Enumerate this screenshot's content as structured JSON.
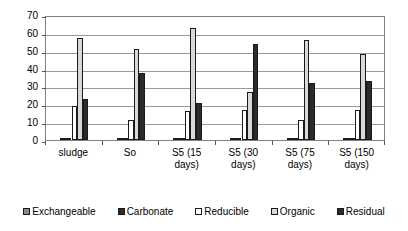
{
  "chart_data": {
    "type": "bar",
    "title": "",
    "xlabel": "",
    "ylabel": "",
    "ylim": [
      0,
      70
    ],
    "yticks": [
      0,
      10,
      20,
      30,
      40,
      50,
      60,
      70
    ],
    "grid": true,
    "legend_position": "bottom",
    "categories": [
      "sludge",
      "So",
      "S5 (15 days)",
      "S5 (30 days)",
      "S5 (75 days)",
      "S5 (150 days)"
    ],
    "category_lines": [
      [
        "sludge"
      ],
      [
        "So"
      ],
      [
        "S5 (15",
        "days)"
      ],
      [
        "S5 (30",
        "days)"
      ],
      [
        "S5 (75",
        "days)"
      ],
      [
        "S5 (150",
        "days)"
      ]
    ],
    "series": [
      {
        "name": "Exchangeable",
        "color": "#8a8a8a",
        "values": [
          0.6,
          0.6,
          0.6,
          0.6,
          0.6,
          0.6
        ]
      },
      {
        "name": "Carbonate",
        "color": "#2b2b2b",
        "values": [
          0.4,
          0.4,
          0.4,
          0.4,
          0.4,
          0.4
        ]
      },
      {
        "name": "Reducible",
        "color": "#ffffff",
        "values": [
          19,
          11,
          16,
          17,
          11,
          17
        ]
      },
      {
        "name": "Organic",
        "color": "#d9d9d9",
        "values": [
          57,
          51,
          63,
          27,
          56,
          48
        ]
      },
      {
        "name": "Residual",
        "color": "#2b2b2b",
        "values": [
          23,
          37.5,
          21,
          54,
          32,
          33
        ]
      }
    ]
  },
  "legend": {
    "items": [
      {
        "label": "Exchangeable",
        "color": "#8a8a8a"
      },
      {
        "label": "Carbonate",
        "color": "#2b2b2b"
      },
      {
        "label": "Reducible",
        "color": "#ffffff"
      },
      {
        "label": "Organic",
        "color": "#d9d9d9"
      },
      {
        "label": "Residual",
        "color": "#2b2b2b"
      }
    ]
  }
}
